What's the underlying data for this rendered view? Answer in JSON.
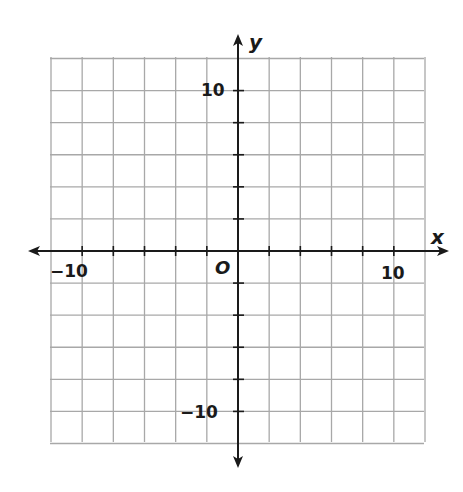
{
  "chart_data": {
    "type": "scatter",
    "title": "",
    "xlabel": "x",
    "ylabel": "y",
    "xlim": [
      -12,
      12
    ],
    "ylim": [
      -12,
      12
    ],
    "grid": true,
    "grid_step": 2,
    "tick_step": 2,
    "tick_labels": {
      "x": [
        "-10",
        "10"
      ],
      "y": [
        "10",
        "-10"
      ]
    },
    "origin_label": "O",
    "series": [],
    "axes_arrows": true
  },
  "labels": {
    "x_axis": "x",
    "y_axis": "y",
    "origin": "O",
    "x_neg": "−10",
    "x_pos": "10",
    "y_pos": "10",
    "y_neg": "−10"
  },
  "colors": {
    "grid": "#a8a8a8",
    "axis": "#1a1a1a",
    "background": "#ffffff"
  }
}
